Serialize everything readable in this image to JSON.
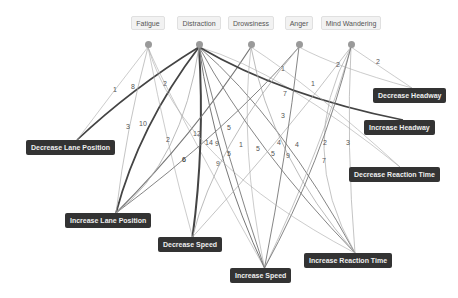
{
  "sources": [
    {
      "id": "fatigue",
      "label": "Fatigue",
      "x": 148,
      "y": 44
    },
    {
      "id": "distraction",
      "label": "Distraction",
      "x": 199,
      "y": 44
    },
    {
      "id": "drowsiness",
      "label": "Drowsiness",
      "x": 251,
      "y": 44
    },
    {
      "id": "anger",
      "label": "Anger",
      "x": 299,
      "y": 44
    },
    {
      "id": "mind_wandering",
      "label": "Mind Wandering",
      "x": 351,
      "y": 44
    }
  ],
  "targets": [
    {
      "id": "decrease_headway",
      "label": "Decrease Headway",
      "x": 373,
      "y": 88
    },
    {
      "id": "increase_headway",
      "label": "Increase Headway",
      "x": 364,
      "y": 120
    },
    {
      "id": "decrease_lane_position",
      "label": "Decrease Lane Position",
      "x": 26,
      "y": 140
    },
    {
      "id": "decrease_reaction_time",
      "label": "Decrease Reaction Time",
      "x": 349,
      "y": 167
    },
    {
      "id": "increase_lane_position",
      "label": "Increase Lane Position",
      "x": 65,
      "y": 213
    },
    {
      "id": "decrease_speed",
      "label": "Decrease Speed",
      "x": 158,
      "y": 237
    },
    {
      "id": "increase_reaction_time",
      "label": "Increase Reaction Time",
      "x": 304,
      "y": 253
    },
    {
      "id": "increase_speed",
      "label": "Increase Speed",
      "x": 230,
      "y": 268
    }
  ],
  "edges": [
    {
      "from": "distraction",
      "to": "decrease_lane_position",
      "weight": "8",
      "lx": 131,
      "ly": 89,
      "w": 1.6
    },
    {
      "from": "fatigue",
      "to": "decrease_lane_position",
      "weight": "1",
      "lx": 113,
      "ly": 92,
      "w": 0.6
    },
    {
      "from": "distraction",
      "to": "increase_lane_position",
      "weight": "10",
      "lx": 139,
      "ly": 126,
      "w": 1.8
    },
    {
      "from": "fatigue",
      "to": "increase_lane_position",
      "weight": "3",
      "lx": 126,
      "ly": 129,
      "w": 0.7
    },
    {
      "from": "fatigue",
      "to": "increase_speed",
      "weight": "2",
      "lx": 163,
      "ly": 86,
      "w": 0.6
    },
    {
      "from": "fatigue",
      "to": "decrease_speed",
      "weight": "2",
      "lx": 166,
      "ly": 142,
      "w": 0.6
    },
    {
      "from": "distraction",
      "to": "decrease_speed",
      "weight": "14",
      "lx": 205,
      "ly": 145,
      "w": 2.0
    },
    {
      "from": "drowsiness",
      "to": "increase_lane_position",
      "weight": "12",
      "lx": 193,
      "ly": 136,
      "w": 1.2
    },
    {
      "from": "distraction",
      "to": "decrease_reaction_time",
      "weight": "1",
      "lx": 281,
      "ly": 71,
      "w": 0.6
    },
    {
      "from": "distraction",
      "to": "increase_headway",
      "weight": "7",
      "lx": 283,
      "ly": 96,
      "w": 1.6
    },
    {
      "from": "distraction",
      "to": "increase_reaction_time",
      "weight": "3",
      "lx": 281,
      "ly": 118,
      "w": 0.9
    },
    {
      "from": "distraction",
      "to": "increase_speed",
      "weight": "9",
      "lx": 216,
      "ly": 166,
      "w": 1.0
    },
    {
      "from": "distraction",
      "to": "increase_speed",
      "weight": "5",
      "lx": 227,
      "ly": 156,
      "w": 0.9
    },
    {
      "from": "anger",
      "to": "increase_lane_position",
      "weight": "5",
      "lx": 227,
      "ly": 130,
      "w": 0.9
    },
    {
      "from": "anger",
      "to": "decrease_speed",
      "weight": "9",
      "lx": 215,
      "ly": 146,
      "w": 0.8
    },
    {
      "from": "drowsiness",
      "to": "increase_speed",
      "weight": "1",
      "lx": 239,
      "ly": 147,
      "w": 0.6
    },
    {
      "from": "distraction",
      "to": "increase_reaction_time",
      "weight": "5",
      "lx": 256,
      "ly": 151,
      "w": 0.9
    },
    {
      "from": "drowsiness",
      "to": "increase_reaction_time",
      "weight": "5",
      "lx": 271,
      "ly": 156,
      "w": 0.8
    },
    {
      "from": "mind_wandering",
      "to": "decrease_speed",
      "weight": "4",
      "lx": 277,
      "ly": 145,
      "w": 0.7
    },
    {
      "from": "anger",
      "to": "increase_speed",
      "weight": "9",
      "lx": 286,
      "ly": 158,
      "w": 0.9
    },
    {
      "from": "mind_wandering",
      "to": "increase_reaction_time",
      "weight": "4",
      "lx": 295,
      "ly": 147,
      "w": 0.7
    },
    {
      "from": "mind_wandering",
      "to": "increase_speed",
      "weight": "2",
      "lx": 323,
      "ly": 145,
      "w": 0.7
    },
    {
      "from": "mind_wandering",
      "to": "increase_reaction_time",
      "weight": "3",
      "lx": 346,
      "ly": 145,
      "w": 0.7
    },
    {
      "from": "mind_wandering",
      "to": "increase_speed",
      "weight": "7",
      "lx": 322,
      "ly": 163,
      "w": 0.9
    },
    {
      "from": "anger",
      "to": "decrease_headway",
      "weight": "2",
      "lx": 336,
      "ly": 67,
      "w": 0.6
    },
    {
      "from": "mind_wandering",
      "to": "decrease_headway",
      "weight": "2",
      "lx": 376,
      "ly": 64,
      "w": 0.6
    },
    {
      "from": "drowsiness",
      "to": "decrease_reaction_time",
      "weight": "1",
      "lx": 311,
      "ly": 86,
      "w": 0.6
    },
    {
      "from": "distraction",
      "to": "increase_lane_position",
      "weight": "6",
      "lx": 182,
      "ly": 162,
      "w": 0.8
    },
    {
      "from": "fatigue",
      "to": "increase_reaction_time",
      "weight": "6",
      "lx": 182,
      "ly": 162,
      "w": 0.6
    }
  ]
}
